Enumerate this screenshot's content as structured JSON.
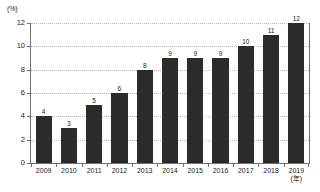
{
  "chart_data": {
    "type": "bar",
    "title": "",
    "subtitle": "",
    "xlabel": "(年)",
    "ylabel": "(%)",
    "categories": [
      "2009",
      "2010",
      "2011",
      "2012",
      "2013",
      "2014",
      "2015",
      "2016",
      "2017",
      "2018",
      "2019"
    ],
    "values": [
      4,
      3,
      5,
      6,
      8,
      9,
      9,
      9,
      10,
      11,
      12
    ],
    "value_labels": [
      "4",
      "3",
      "5",
      "6",
      "8",
      "9",
      "9",
      "9",
      "10",
      "11",
      "12"
    ],
    "ylim": [
      0,
      12
    ],
    "y_ticks": [
      0,
      2,
      4,
      6,
      8,
      10,
      12
    ],
    "y_tick_labels": [
      "0",
      "2",
      "4",
      "6",
      "8",
      "10",
      "12"
    ],
    "grid": true,
    "grid_axis": "y",
    "legend": false,
    "legend_position": "none",
    "series": [
      {
        "name": "",
        "values": [
          4,
          3,
          5,
          6,
          8,
          9,
          9,
          9,
          10,
          11,
          12
        ],
        "color": "#2b2b2b"
      }
    ],
    "colors": {
      "bar": "#2b2b2b",
      "axis": "#6e6e6e",
      "gridline": "#b9b9b9",
      "text": "#1a1a1a",
      "background": "#ffffff"
    }
  }
}
